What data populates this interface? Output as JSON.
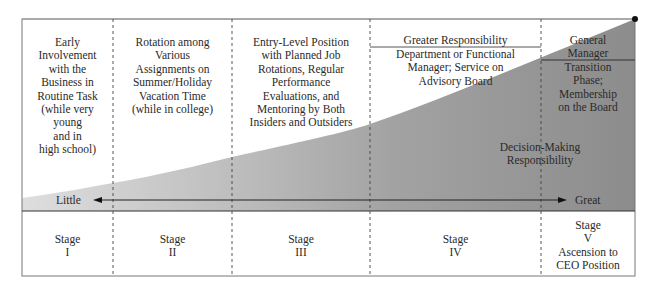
{
  "stages": [
    {
      "stage_label": "Stage",
      "numeral": "I",
      "description": [
        "Early",
        "Involvement",
        "with the",
        "Business in",
        "Routine Task",
        "(while very",
        "young",
        "and in",
        "high school)"
      ]
    },
    {
      "stage_label": "Stage",
      "numeral": "II",
      "description": [
        "Rotation among",
        "Various",
        "Assignments on",
        "Summer/Holiday",
        "Vacation Time",
        "(while in college)"
      ]
    },
    {
      "stage_label": "Stage",
      "numeral": "III",
      "description": [
        "Entry-Level Position",
        "with Planned Job",
        "Rotations, Regular",
        "Performance",
        "Evaluations, and",
        "Mentoring by Both",
        "Insiders and Outsiders"
      ]
    },
    {
      "stage_label": "Stage",
      "numeral": "IV",
      "header": "Greater Responsibility",
      "description": [
        "Department or Functional",
        "Manager; Service on",
        "Advisory Board"
      ]
    },
    {
      "stage_label": "Stage",
      "numeral": "V",
      "extra": [
        "Ascension to",
        "CEO Position"
      ],
      "header": [
        "General",
        "Manager"
      ],
      "description": [
        "Transition",
        "Phase;",
        "Membership",
        "on the Board"
      ]
    }
  ],
  "axis": {
    "title": [
      "Decision-Making",
      "Responsibility"
    ],
    "low_label": "Little",
    "high_label": "Great"
  },
  "colors": {
    "wedge_light": "#d9d9d9",
    "wedge_dark": "#8f8f8f",
    "border": "#555555",
    "text": "#2a2a2a"
  }
}
